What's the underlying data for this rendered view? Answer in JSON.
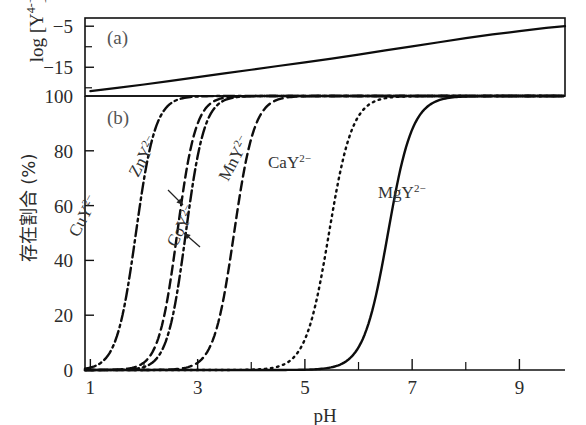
{
  "figure": {
    "background": "#ffffff",
    "ink_color": "#0d0d0d"
  },
  "chart_data": {
    "type": "line",
    "title": "",
    "xlabel": "pH",
    "xlim": [
      0.9,
      9.85
    ],
    "xticks": [
      1,
      3,
      5,
      7,
      9
    ],
    "xticklabels": [
      "1",
      "3",
      "5",
      "7",
      "9"
    ],
    "xminorticks": [
      2,
      4,
      6,
      8
    ],
    "grid": false,
    "legend": "inline-annotations",
    "panels": [
      {
        "tag": "(a)",
        "ylabel": "log [Y4-]",
        "ylabel_base": "log [Y",
        "ylabel_sup": "4-",
        "ylabel_tail": "]",
        "ylim": [
          -22,
          -3
        ],
        "yticks": [
          -5,
          -15
        ],
        "yticklabels": [
          "-5",
          "-15"
        ],
        "yminorticks": [
          -10,
          -20
        ],
        "series": [
          {
            "name": "log[Y4-] vs pH",
            "style": "solid",
            "x": [
              1.0,
              1.5,
              2.0,
              2.5,
              3.0,
              3.5,
              4.0,
              4.5,
              5.0,
              5.5,
              6.0,
              6.5,
              7.0,
              7.5,
              8.0,
              8.5,
              9.0,
              9.5,
              9.85
            ],
            "y": [
              -20.8,
              -20.0,
              -19.2,
              -18.3,
              -17.4,
              -16.5,
              -15.6,
              -14.7,
              -13.8,
              -12.9,
              -11.9,
              -10.9,
              -9.9,
              -8.9,
              -7.9,
              -7.0,
              -6.2,
              -5.4,
              -5.0
            ]
          }
        ]
      },
      {
        "tag": "(b)",
        "ylabel": "存在割合 (%)",
        "ylim": [
          0,
          100
        ],
        "yticks": [
          0,
          20,
          40,
          60,
          80,
          100
        ],
        "yticklabels": [
          "0",
          "20",
          "40",
          "60",
          "80",
          "100"
        ],
        "series": [
          {
            "name": "CuY2-",
            "label_base": "CuY",
            "label_sup": "2-",
            "style": "dashdot",
            "midpoint_pH": 1.85,
            "slope": 2.4,
            "label_rotation": -62,
            "has_leader": false
          },
          {
            "name": "ZnY2-",
            "label_base": "ZnY",
            "label_sup": "2-",
            "style": "dashed",
            "midpoint_pH": 2.62,
            "slope": 2.5,
            "label_rotation": -62,
            "has_leader": true
          },
          {
            "name": "CoY2-",
            "label_base": "CoY",
            "label_sup": "2-",
            "style": "dashdot",
            "midpoint_pH": 2.78,
            "slope": 2.5,
            "label_rotation": -62,
            "has_leader": true
          },
          {
            "name": "MnY2-",
            "label_base": "MnY",
            "label_sup": "2-",
            "style": "dashed",
            "midpoint_pH": 3.68,
            "slope": 2.3,
            "label_rotation": -62,
            "has_leader": false
          },
          {
            "name": "CaY2-",
            "label_base": "CaY",
            "label_sup": "2-",
            "style": "dotted",
            "midpoint_pH": 5.45,
            "slope": 2.0,
            "label_rotation": 0,
            "has_leader": false
          },
          {
            "name": "MgY2-",
            "label_base": "MgY",
            "label_sup": "2-",
            "style": "solid",
            "midpoint_pH": 6.55,
            "slope": 1.9,
            "label_rotation": 0,
            "has_leader": false
          }
        ]
      }
    ]
  }
}
